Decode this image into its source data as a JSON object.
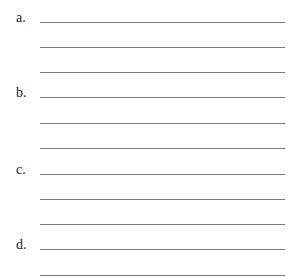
{
  "worksheet": {
    "items": [
      {
        "label": "a.",
        "lines": 3
      },
      {
        "label": "b.",
        "lines": 3
      },
      {
        "label": "c.",
        "lines": 3
      },
      {
        "label": "d.",
        "lines": 2
      }
    ]
  }
}
